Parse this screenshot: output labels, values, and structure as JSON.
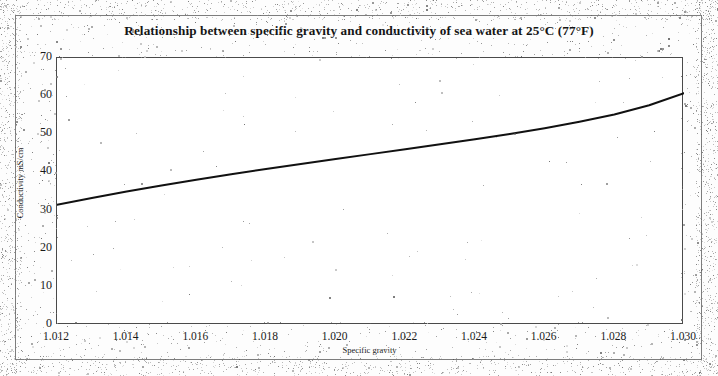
{
  "chart_data": {
    "type": "line",
    "title": "Relationship between specific gravity and conductivity of sea water at 25°C (77°F)",
    "xlabel": "Specific gravity",
    "ylabel": "Conductivity mS/cm",
    "xlim": [
      1.012,
      1.03
    ],
    "ylim": [
      0,
      70
    ],
    "xticks": [
      "1.012",
      "1.014",
      "1.016",
      "1.018",
      "1.020",
      "1.022",
      "1.024",
      "1.026",
      "1.028",
      "1.030"
    ],
    "xtick_values": [
      1.012,
      1.014,
      1.016,
      1.018,
      1.02,
      1.022,
      1.024,
      1.026,
      1.028,
      1.03
    ],
    "yticks": [
      "0",
      "10",
      "20",
      "30",
      "40",
      "50",
      "60",
      "70"
    ],
    "ytick_values": [
      0,
      10,
      20,
      30,
      40,
      50,
      60,
      70
    ],
    "grid": false,
    "legend": false,
    "line_color": "#111111",
    "series": [
      {
        "name": "Conductivity of sea water at 25°C",
        "x": [
          1.012,
          1.013,
          1.014,
          1.015,
          1.016,
          1.017,
          1.018,
          1.019,
          1.02,
          1.021,
          1.022,
          1.023,
          1.024,
          1.025,
          1.026,
          1.027,
          1.028,
          1.029,
          1.03
        ],
        "values": [
          31.5,
          33.3,
          35.0,
          36.6,
          38.1,
          39.5,
          40.9,
          42.2,
          43.5,
          44.8,
          46.1,
          47.4,
          48.7,
          50.1,
          51.6,
          53.3,
          55.2,
          57.6,
          60.8
        ]
      }
    ]
  }
}
